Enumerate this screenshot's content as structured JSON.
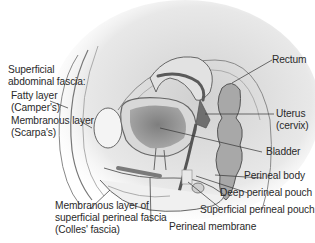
{
  "diagram": {
    "colors": {
      "background": "#ffffff",
      "text": "#2a2a2a",
      "leader_line": "#333333",
      "tissue_light": "#e6e6e6",
      "tissue_mid": "#bdbdbd",
      "organ_dark": "#8a8a8a",
      "outline": "#555555"
    },
    "labels": {
      "superficial_abdominal_fascia": [
        "Superficial",
        "abdominal fascia:"
      ],
      "fatty_layer": [
        "Fatty layer",
        "(Camper's)"
      ],
      "membranous_layer": [
        "Membranous layer",
        "(Scarpa's)"
      ],
      "rectum": "Rectum",
      "uterus": [
        "Uterus",
        "(cervix)"
      ],
      "bladder": "Bladder",
      "perineal_body": "Perineal body",
      "deep_perineal_pouch": "Deep perineal pouch",
      "superficial_perineal_pouch": "Superficial perineal pouch",
      "perineal_membrane": "Perineal membrane",
      "colles_fascia": [
        "Membranous layer of",
        "superficial perineal fascia",
        "(Colles' fascia)"
      ]
    }
  }
}
